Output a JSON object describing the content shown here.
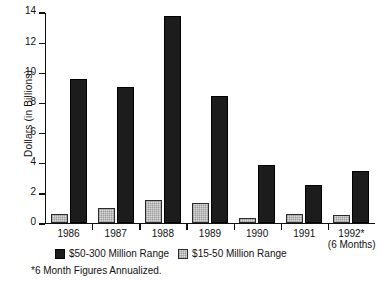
{
  "chart_data": {
    "type": "bar",
    "title": "",
    "xlabel": "",
    "ylabel": "Dollars (in Billions)",
    "ylim": [
      0,
      14
    ],
    "yticks": [
      0,
      2,
      4,
      6,
      8,
      10,
      12,
      14
    ],
    "ytick_labels": [
      "0",
      "2",
      "4",
      "6",
      "8",
      "10",
      "12",
      "14"
    ],
    "grid": false,
    "legend_position": "below-axis",
    "categories": [
      "1986",
      "1987",
      "1988",
      "1989",
      "1990",
      "1991",
      "1992*"
    ],
    "category_sublabels": [
      "",
      "",
      "",
      "",
      "",
      "",
      "(6 Months)"
    ],
    "series": [
      {
        "name": "$15-50 Million Range",
        "color": "#d8d8d8",
        "values": [
          0.6,
          0.95,
          1.5,
          1.27,
          0.3,
          0.6,
          0.5
        ]
      },
      {
        "name": "$50-300 Million Range",
        "color": "#1c1c1c",
        "values": [
          9.5,
          9.0,
          13.7,
          8.4,
          3.85,
          2.5,
          3.45
        ]
      }
    ],
    "legend_order": [
      "$50-300 Million Range",
      "$15-50 Million Range"
    ],
    "annotations": [
      "*6 Month Figures Annualized."
    ]
  },
  "legend": {
    "entries": [
      {
        "label": "$50-300 Million Range",
        "swatch": "dark"
      },
      {
        "label": "$15-50 Million Range",
        "swatch": "light"
      }
    ]
  },
  "footnote": "*6 Month Figures Annualized."
}
